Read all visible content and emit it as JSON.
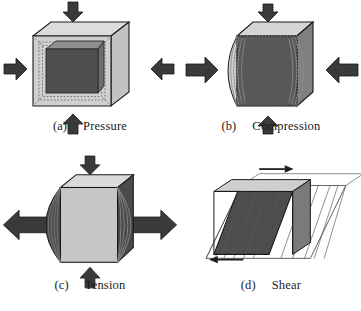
{
  "figure": {
    "background_color": "#ffffff",
    "ink_color": "#1a1a1a",
    "panel_count": 4
  },
  "palette": {
    "arrow_fill": "#3a3a3a",
    "arrow_stroke": "#1a1a1a",
    "outline": "#1a1a1a",
    "light_face": "#c9c9c9",
    "lighter_face": "#dcdcdc",
    "top_face": "#d8d8d8",
    "mid_face": "#9a9a9a",
    "dark_face": "#5a5a5a",
    "darker_face": "#4a4a4a",
    "hatch_line": "#6f6f6f"
  },
  "panels": [
    {
      "id": "a",
      "index_label": "(a)",
      "title": "Pressure",
      "stress_type": "pressure",
      "description": "Cube compressed equally from all sides; dark inner cube shrinks inside lighter original outline.",
      "arrows": [
        {
          "name": "arrow-top-down",
          "direction": "down",
          "style": "block"
        },
        {
          "name": "arrow-left-right",
          "direction": "right",
          "style": "block"
        },
        {
          "name": "arrow-right-left",
          "direction": "left",
          "style": "block"
        },
        {
          "name": "arrow-bottom-up",
          "direction": "up",
          "style": "block"
        }
      ]
    },
    {
      "id": "b",
      "index_label": "(b)",
      "title": "Compression",
      "stress_type": "compression",
      "description": "Cube squeezed horizontally; vertical faces bulge outward into crescent shapes on left and right.",
      "arrows": [
        {
          "name": "arrow-top-down",
          "direction": "down",
          "style": "block"
        },
        {
          "name": "arrow-left-right",
          "direction": "right",
          "style": "block"
        },
        {
          "name": "arrow-right-left",
          "direction": "left",
          "style": "block"
        },
        {
          "name": "arrow-bottom-up",
          "direction": "up",
          "style": "block"
        }
      ]
    },
    {
      "id": "c",
      "index_label": "(c)",
      "title": "Tension",
      "stress_type": "tension",
      "description": "Cube pulled horizontally outward; dark bulges extend beyond the left and right faces.",
      "arrows": [
        {
          "name": "arrow-top-down",
          "direction": "down",
          "style": "block"
        },
        {
          "name": "arrow-left-out",
          "direction": "left",
          "style": "long"
        },
        {
          "name": "arrow-right-out",
          "direction": "right",
          "style": "long"
        },
        {
          "name": "arrow-bottom-up",
          "direction": "up",
          "style": "block"
        }
      ]
    },
    {
      "id": "d",
      "index_label": "(d)",
      "title": "Shear",
      "stress_type": "shear",
      "description": "Cube sheared sideways into a parallelepiped; top slides right while bottom slides left.",
      "arrows": [
        {
          "name": "arrow-top-shear-right",
          "direction": "right",
          "style": "thin"
        },
        {
          "name": "arrow-bottom-shear-left",
          "direction": "left",
          "style": "thin"
        }
      ]
    }
  ]
}
